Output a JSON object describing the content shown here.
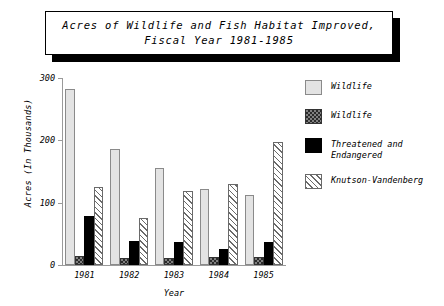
{
  "title": {
    "line1": "Acres of Wildlife and Fish Habitat Improved,",
    "line2": "Fiscal Year 1981-1985"
  },
  "legend": {
    "items": [
      {
        "label": "Wildlife",
        "pattern": "solid-light-gray",
        "color": "#e3e3e3"
      },
      {
        "label": "Wildlife",
        "pattern": "checkered-dark",
        "color": "#2b2b2b"
      },
      {
        "label": "Threatened and Endangered",
        "pattern": "solid-black",
        "color": "#000000"
      },
      {
        "label": "Knutson-Vandenberg",
        "pattern": "diagonal-hatch",
        "color": "#6a6a6a"
      }
    ]
  },
  "chart_data": {
    "type": "bar",
    "title": "Acres of Wildlife and Fish Habitat Improved, Fiscal Year 1981-1985",
    "xlabel": "Year",
    "ylabel": "Acres (In Thousands)",
    "categories": [
      "1981",
      "1982",
      "1983",
      "1984",
      "1985"
    ],
    "ylim": [
      0,
      300
    ],
    "yticks": [
      0,
      100,
      200,
      300
    ],
    "ytick_labels": [
      "0",
      "100",
      "200",
      "300"
    ],
    "grid": false,
    "legend_position": "right",
    "series": [
      {
        "name": "Wildlife",
        "pattern": "solid-light-gray",
        "values": [
          283,
          186,
          155,
          122,
          113
        ]
      },
      {
        "name": "Wildlife",
        "pattern": "checkered-dark",
        "values": [
          15,
          12,
          12,
          13,
          13
        ]
      },
      {
        "name": "Threatened and Endangered",
        "pattern": "solid-black",
        "values": [
          78,
          38,
          37,
          25,
          37
        ]
      },
      {
        "name": "Knutson-Vandenberg",
        "pattern": "diagonal-hatch",
        "values": [
          125,
          75,
          118,
          130,
          197
        ]
      }
    ]
  }
}
